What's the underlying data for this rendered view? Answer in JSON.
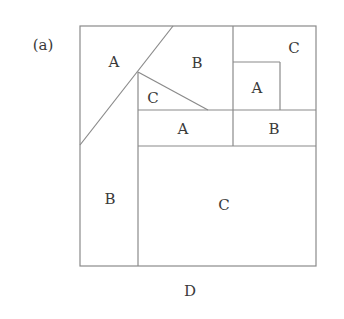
{
  "panel_label": "(a)",
  "bottom_label": "D",
  "colors": {
    "line": "#8a8a8a",
    "text": "#3a3a3a",
    "background": "#ffffff"
  },
  "regions": [
    {
      "id": "top-left-triangle",
      "label": "A"
    },
    {
      "id": "top-middle",
      "label": "B"
    },
    {
      "id": "top-right",
      "label": "C"
    },
    {
      "id": "small-square",
      "label": "A"
    },
    {
      "id": "small-triangle",
      "label": "C"
    },
    {
      "id": "middle-strip-left",
      "label": "A"
    },
    {
      "id": "middle-strip-right",
      "label": "B"
    },
    {
      "id": "left-column",
      "label": "B"
    },
    {
      "id": "bottom-large",
      "label": "C"
    }
  ]
}
